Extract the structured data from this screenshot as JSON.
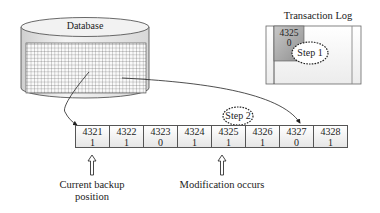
{
  "database": {
    "label": "Database"
  },
  "transaction_log": {
    "title": "Transaction Log",
    "entry": {
      "block": "4325",
      "value": "0"
    },
    "step_label": "Step 1"
  },
  "blocks": [
    {
      "id": "4321",
      "value": "1"
    },
    {
      "id": "4322",
      "value": "1"
    },
    {
      "id": "4323",
      "value": "0"
    },
    {
      "id": "4324",
      "value": "1"
    },
    {
      "id": "4325",
      "value": "1"
    },
    {
      "id": "4326",
      "value": "1"
    },
    {
      "id": "4327",
      "value": "0"
    },
    {
      "id": "4328",
      "value": "1"
    }
  ],
  "step2": {
    "label": "Step 2"
  },
  "annotations": {
    "current_backup_line1": "Current backup",
    "current_backup_line2": "position",
    "modification": "Modification occurs"
  }
}
